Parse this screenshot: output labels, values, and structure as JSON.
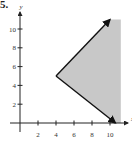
{
  "problem_number": "5.",
  "colors": {
    "region": "#c8c8c8",
    "axis": "#222222",
    "boundary": "#111111",
    "text": "#333333"
  },
  "chart_data": {
    "type": "area",
    "title": "",
    "xlabel": "x",
    "ylabel": "y",
    "xticks": [
      2,
      4,
      6,
      8,
      10
    ],
    "yticks": [
      2,
      4,
      6,
      8,
      10
    ],
    "xlim": [
      0,
      11.2
    ],
    "ylim": [
      0,
      11.2
    ],
    "grid": false,
    "vertex": [
      4,
      5
    ],
    "boundary_rays": [
      {
        "from": [
          4,
          5
        ],
        "to": [
          10,
          11
        ],
        "arrow": true
      },
      {
        "from": [
          4,
          5
        ],
        "to": [
          10.6,
          0
        ],
        "arrow": true
      }
    ],
    "shaded_region": "area to the right of vertex (4,5), between the two rays, extending right to x≈11",
    "polygon": [
      [
        4,
        5
      ],
      [
        10,
        11
      ],
      [
        11.2,
        11
      ],
      [
        11.2,
        0
      ],
      [
        10.6,
        0
      ]
    ]
  }
}
